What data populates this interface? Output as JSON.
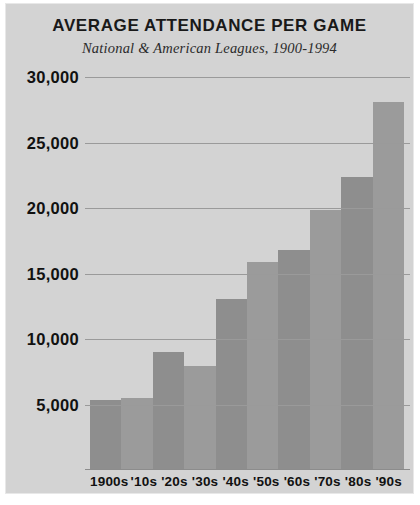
{
  "chart_data": {
    "type": "bar",
    "title": "AVERAGE ATTENDANCE PER GAME",
    "subtitle": "National & American Leagues, 1900-1994",
    "xlabel": "",
    "ylabel": "",
    "categories": [
      "1900s",
      "'10s",
      "'20s",
      "'30s",
      "'40s",
      "'50s",
      "'60s",
      "'70s",
      "'80s",
      "'90s"
    ],
    "values": [
      5300,
      5400,
      8900,
      7900,
      13000,
      15800,
      16700,
      19800,
      22300,
      28000
    ],
    "ylim": [
      0,
      31000
    ],
    "y_ticks": [
      5000,
      10000,
      15000,
      20000,
      25000,
      30000
    ],
    "y_tick_labels": [
      "5,000",
      "10,000",
      "15,000",
      "20,000",
      "25,000",
      "30,000"
    ],
    "grid": true,
    "legend": "none",
    "colors": {
      "background": "#d3d3d3",
      "bar_dark": "#8e8e8e",
      "bar_light": "#9b9b9b",
      "gridline": "#9a9a9a",
      "text": "#111111"
    }
  }
}
